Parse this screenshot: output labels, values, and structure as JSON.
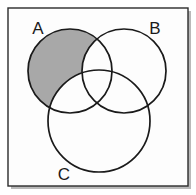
{
  "figure": {
    "type": "venn-diagram",
    "title": "",
    "set_count": 3,
    "background_color": "#ffffff",
    "frame": {
      "name": "diagram-frame",
      "x": 8,
      "y": 8,
      "width": 180,
      "height": 178,
      "stroke_color": "#2b2b2b",
      "fill_color": "#fdfdfd",
      "stroke_width": 1.4,
      "shadow_color": "#b9b9b9"
    },
    "circles": [
      {
        "id": "A",
        "name": "circle-a",
        "label": "A",
        "cx": 70,
        "cy": 71,
        "r": 42,
        "fill": "#ffffff",
        "stroke": "#1a1a1a",
        "stroke_width": 1.7
      },
      {
        "id": "B",
        "name": "circle-b",
        "label": "B",
        "cx": 124,
        "cy": 71,
        "r": 42,
        "fill": "#ffffff",
        "stroke": "#1a1a1a",
        "stroke_width": 1.7
      },
      {
        "id": "C",
        "name": "circle-c",
        "label": "C",
        "cx": 99,
        "cy": 121,
        "r": 51,
        "fill": "#ffffff",
        "stroke": "#1a1a1a",
        "stroke_width": 1.7
      }
    ],
    "labels": [
      {
        "id": "A",
        "name": "label-a",
        "text": "A",
        "x": 38,
        "y": 34,
        "font_size": 17
      },
      {
        "id": "B",
        "name": "label-b",
        "text": "B",
        "x": 155,
        "y": 34,
        "font_size": 17
      },
      {
        "id": "C",
        "name": "label-c",
        "text": "C",
        "x": 64,
        "y": 180,
        "font_size": 17
      }
    ],
    "shaded_region": {
      "name": "shaded-region-a-only",
      "description": "A only",
      "expression": "A − (B ∪ C)",
      "fill_color": "#a8a8a8",
      "shaded_sets": [
        "A"
      ],
      "excluded_sets": [
        "B",
        "C"
      ]
    }
  }
}
